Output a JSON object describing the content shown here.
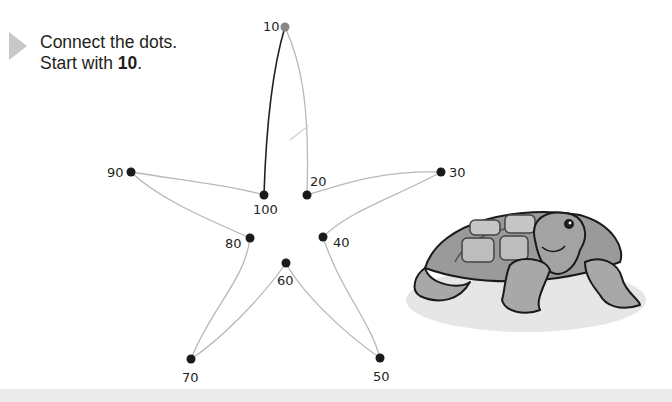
{
  "instructions": {
    "line1": "Connect the dots.",
    "line2_prefix": "Start with ",
    "line2_bold": "10",
    "line2_suffix": "."
  },
  "puzzle": {
    "shape": "starfish",
    "start_value": "10",
    "dots": [
      {
        "label": "10",
        "x": 285,
        "y": 27,
        "lx": 263,
        "ly": 20,
        "color": "#888888"
      },
      {
        "label": "20",
        "x": 307,
        "y": 195,
        "lx": 310,
        "ly": 175,
        "color": "#1a1a1a"
      },
      {
        "label": "30",
        "x": 441,
        "y": 172,
        "lx": 449,
        "ly": 166,
        "color": "#1a1a1a"
      },
      {
        "label": "40",
        "x": 323,
        "y": 237,
        "lx": 333,
        "ly": 236,
        "color": "#1a1a1a"
      },
      {
        "label": "50",
        "x": 380,
        "y": 358,
        "lx": 373,
        "ly": 370,
        "color": "#1a1a1a"
      },
      {
        "label": "60",
        "x": 286,
        "y": 263,
        "lx": 277,
        "ly": 274,
        "color": "#1a1a1a"
      },
      {
        "label": "70",
        "x": 191,
        "y": 359,
        "lx": 182,
        "ly": 371,
        "color": "#1a1a1a"
      },
      {
        "label": "80",
        "x": 250,
        "y": 238,
        "lx": 225,
        "ly": 237,
        "color": "#1a1a1a"
      },
      {
        "label": "90",
        "x": 131,
        "y": 172,
        "lx": 107,
        "ly": 166,
        "color": "#1a1a1a"
      },
      {
        "label": "100",
        "x": 264,
        "y": 195,
        "lx": 253,
        "ly": 203,
        "color": "#1a1a1a"
      }
    ]
  },
  "illustration": {
    "subject": "turtle"
  },
  "colors": {
    "text": "#231f20",
    "arrow": "#c8c8c8",
    "guide_line": "#b8b8b8",
    "drawn_line": "#222222",
    "footer_band": "#ebebeb"
  }
}
